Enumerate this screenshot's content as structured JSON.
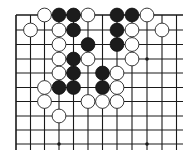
{
  "board": {
    "type": "go-diagram",
    "view": "top-left corner fragment",
    "columns_visible": 12,
    "rows_visible": 10,
    "open_edges": [
      "right",
      "bottom"
    ],
    "star_points": [
      {
        "col": 10,
        "row": 4
      },
      {
        "col": 4,
        "row": 10
      },
      {
        "col": 10,
        "row": 10
      }
    ],
    "stones": [
      {
        "color": "white",
        "col": 3,
        "row": 1
      },
      {
        "color": "black",
        "col": 4,
        "row": 1
      },
      {
        "color": "black",
        "col": 5,
        "row": 1
      },
      {
        "color": "white",
        "col": 6,
        "row": 1
      },
      {
        "color": "black",
        "col": 8,
        "row": 1
      },
      {
        "color": "black",
        "col": 9,
        "row": 1
      },
      {
        "color": "white",
        "col": 10,
        "row": 1
      },
      {
        "color": "white",
        "col": 2,
        "row": 2
      },
      {
        "color": "white",
        "col": 4,
        "row": 2
      },
      {
        "color": "black",
        "col": 5,
        "row": 2
      },
      {
        "color": "black",
        "col": 8,
        "row": 2
      },
      {
        "color": "white",
        "col": 9,
        "row": 2
      },
      {
        "color": "white",
        "col": 11,
        "row": 2
      },
      {
        "color": "white",
        "col": 4,
        "row": 3
      },
      {
        "color": "black",
        "col": 6,
        "row": 3
      },
      {
        "color": "black",
        "col": 8,
        "row": 3
      },
      {
        "color": "white",
        "col": 9,
        "row": 3
      },
      {
        "color": "white",
        "col": 4,
        "row": 4
      },
      {
        "color": "black",
        "col": 5,
        "row": 4
      },
      {
        "color": "white",
        "col": 6,
        "row": 4
      },
      {
        "color": "white",
        "col": 9,
        "row": 4
      },
      {
        "color": "white",
        "col": 4,
        "row": 5
      },
      {
        "color": "black",
        "col": 5,
        "row": 5
      },
      {
        "color": "black",
        "col": 7,
        "row": 5
      },
      {
        "color": "white",
        "col": 8,
        "row": 5
      },
      {
        "color": "white",
        "col": 3,
        "row": 6
      },
      {
        "color": "black",
        "col": 4,
        "row": 6
      },
      {
        "color": "black",
        "col": 5,
        "row": 6
      },
      {
        "color": "black",
        "col": 7,
        "row": 6
      },
      {
        "color": "white",
        "col": 8,
        "row": 6
      },
      {
        "color": "white",
        "col": 3,
        "row": 7
      },
      {
        "color": "white",
        "col": 6,
        "row": 7
      },
      {
        "color": "white",
        "col": 7,
        "row": 7
      },
      {
        "color": "white",
        "col": 8,
        "row": 7
      },
      {
        "color": "white",
        "col": 4,
        "row": 8
      }
    ],
    "colors": {
      "background": "#ffffff",
      "line": "#1a1a1a",
      "black_stone": "#1c1c1c",
      "white_stone": "#ffffff"
    }
  }
}
